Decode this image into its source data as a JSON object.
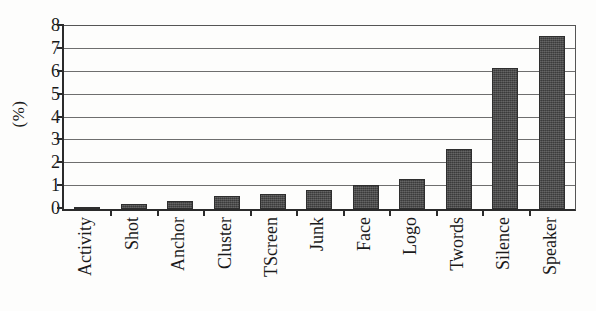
{
  "chart_data": {
    "type": "bar",
    "title": "",
    "xlabel": "",
    "ylabel": "(%)",
    "categories": [
      "Activity",
      "Shot",
      "Anchor",
      "Cluster",
      "TScreen",
      "Junk",
      "Face",
      "Logo",
      "Twords",
      "Silence",
      "Speaker"
    ],
    "values": [
      0.08,
      0.2,
      0.35,
      0.58,
      0.67,
      0.85,
      1.07,
      1.3,
      2.62,
      6.18,
      7.55
    ],
    "ylim": [
      0,
      8
    ],
    "ytick_labels": [
      "0",
      "1",
      "2",
      "3",
      "4",
      "5",
      "6",
      "7",
      "8"
    ],
    "ytick_values": [
      0,
      1,
      2,
      3,
      4,
      5,
      6,
      7,
      8
    ],
    "grid": true,
    "legend": false,
    "legend_position": "none",
    "bar_color": "#474747",
    "bar_edge_color": "#2e2e2e",
    "axis_color": "#2b2b2b",
    "gridline_color": "#6e6e6e",
    "background_color": "#fdfdfc",
    "series": [
      {
        "name": "Percentage",
        "values": [
          0.08,
          0.2,
          0.35,
          0.58,
          0.67,
          0.85,
          1.07,
          1.3,
          2.62,
          6.18,
          7.55
        ]
      }
    ]
  }
}
